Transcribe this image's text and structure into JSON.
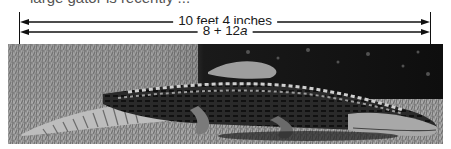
{
  "caption_fragment": "large gator is recently ...",
  "dimensions": [
    {
      "label": "10 feet 4 inches",
      "y": 22
    },
    {
      "label_prefix": "8 + 12",
      "label_var": "a",
      "y": 32
    }
  ],
  "colors": {
    "ink": "#111111",
    "background": "#ffffff"
  }
}
